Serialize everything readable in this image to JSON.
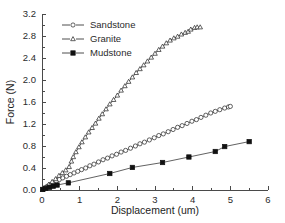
{
  "chart_data": {
    "type": "line",
    "title": "",
    "xlabel": "Displacement (um)",
    "ylabel": "Force (N)",
    "xlim": [
      0,
      6
    ],
    "ylim": [
      0.0,
      3.2
    ],
    "xticks": [
      "0",
      "1",
      "2",
      "3",
      "4",
      "5",
      "6"
    ],
    "yticks": [
      "0.0",
      "0.4",
      "0.8",
      "1.2",
      "1.6",
      "2.0",
      "2.4",
      "2.8",
      "3.2"
    ],
    "grid": false,
    "legend_position": "top-left",
    "series": [
      {
        "name": "Sandstone",
        "marker": "open-circle",
        "x": [
          0.02,
          0.08,
          0.15,
          0.22,
          0.3,
          0.38,
          0.46,
          0.55,
          0.65,
          0.75,
          0.85,
          0.95,
          1.05,
          1.16,
          1.27,
          1.38,
          1.5,
          1.62,
          1.74,
          1.86,
          1.98,
          2.1,
          2.22,
          2.35,
          2.48,
          2.6,
          2.72,
          2.85,
          2.98,
          3.1,
          3.22,
          3.35,
          3.48,
          3.6,
          3.72,
          3.85,
          3.98,
          4.1,
          4.22,
          4.35,
          4.48,
          4.6,
          4.72,
          4.85,
          4.95,
          5.0
        ],
        "y": [
          0.01,
          0.04,
          0.07,
          0.1,
          0.13,
          0.16,
          0.19,
          0.22,
          0.25,
          0.28,
          0.31,
          0.34,
          0.37,
          0.4,
          0.44,
          0.47,
          0.51,
          0.55,
          0.58,
          0.62,
          0.65,
          0.69,
          0.72,
          0.76,
          0.8,
          0.84,
          0.87,
          0.91,
          0.95,
          0.99,
          1.02,
          1.06,
          1.1,
          1.14,
          1.17,
          1.21,
          1.25,
          1.28,
          1.32,
          1.36,
          1.4,
          1.43,
          1.46,
          1.49,
          1.51,
          1.52
        ]
      },
      {
        "name": "Granite",
        "marker": "open-triangle",
        "x": [
          0.02,
          0.1,
          0.18,
          0.27,
          0.36,
          0.45,
          0.54,
          0.63,
          0.72,
          0.78,
          0.83,
          0.9,
          0.98,
          1.06,
          1.15,
          1.24,
          1.33,
          1.42,
          1.51,
          1.6,
          1.7,
          1.8,
          1.9,
          2.0,
          2.1,
          2.2,
          2.3,
          2.4,
          2.5,
          2.6,
          2.7,
          2.8,
          2.9,
          3.0,
          3.1,
          3.2,
          3.3,
          3.4,
          3.5,
          3.6,
          3.7,
          3.8,
          3.88,
          3.95,
          4.05,
          4.12,
          4.2
        ],
        "y": [
          0.01,
          0.05,
          0.1,
          0.15,
          0.2,
          0.26,
          0.31,
          0.36,
          0.42,
          0.52,
          0.6,
          0.69,
          0.78,
          0.87,
          0.96,
          1.05,
          1.13,
          1.21,
          1.3,
          1.38,
          1.47,
          1.56,
          1.64,
          1.72,
          1.81,
          1.89,
          1.97,
          2.05,
          2.13,
          2.2,
          2.27,
          2.34,
          2.41,
          2.48,
          2.55,
          2.61,
          2.67,
          2.72,
          2.76,
          2.79,
          2.83,
          2.86,
          2.88,
          2.92,
          2.95,
          2.96,
          2.96
        ]
      },
      {
        "name": "Mudstone",
        "marker": "filled-square",
        "x": [
          0.02,
          0.1,
          0.2,
          0.3,
          0.4,
          0.7,
          1.8,
          2.4,
          3.2,
          3.9,
          4.6,
          4.85,
          5.5
        ],
        "y": [
          0.01,
          0.03,
          0.05,
          0.07,
          0.09,
          0.13,
          0.3,
          0.41,
          0.5,
          0.6,
          0.7,
          0.79,
          0.88
        ]
      }
    ]
  },
  "legend": {
    "items": [
      {
        "label": "Sandstone",
        "marker": "open-circle"
      },
      {
        "label": "Granite",
        "marker": "open-triangle"
      },
      {
        "label": "Mudstone",
        "marker": "filled-square"
      }
    ]
  }
}
